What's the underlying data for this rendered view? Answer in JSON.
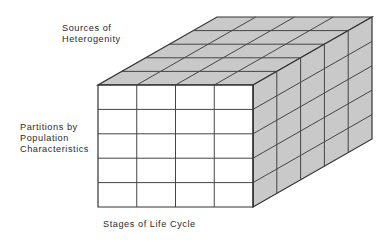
{
  "figure": {
    "name": "three-dimensional-data-cube",
    "background_color": "#ffffff"
  },
  "labels": {
    "top_axis": {
      "name": "sources-of-heterogenity",
      "lines": [
        "Sources of",
        "Heterogenity"
      ],
      "text": "Sources of\nHeterogenity"
    },
    "left_axis": {
      "name": "partitions-by-population-characteristics",
      "lines": [
        "Partitions by",
        "Population",
        "Characteristics"
      ],
      "text": "Partitions by\nPopulation\nCharacteristics"
    },
    "bottom_axis": {
      "name": "stages-of-life-cycle",
      "lines": [
        "Stages of Life Cycle"
      ],
      "text": "Stages of Life Cycle"
    }
  },
  "cube": {
    "front_face": {
      "name": "front-face",
      "fill": "#ffffff",
      "columns": 4,
      "rows": 5,
      "left": 98,
      "top": 85,
      "right": 253,
      "bottom": 207
    },
    "top_face": {
      "name": "top-face",
      "fill": "#c9c9c9",
      "columns": 4,
      "depth_rows": 5
    },
    "side_face": {
      "name": "right-side-face",
      "fill": "#c9c9c9",
      "depth_columns": 5,
      "rows": 5
    },
    "depth_offset": {
      "dx": 119,
      "dy": -68
    },
    "stroke_color": "#333333",
    "stroke_width": 1.2,
    "inner_stroke_color": "#454545",
    "inner_stroke_width": 1.0
  },
  "colors": {
    "shaded_gray": "#c9c9c9",
    "white": "#ffffff",
    "line_dark": "#333333",
    "text": "#2b2b2b"
  }
}
